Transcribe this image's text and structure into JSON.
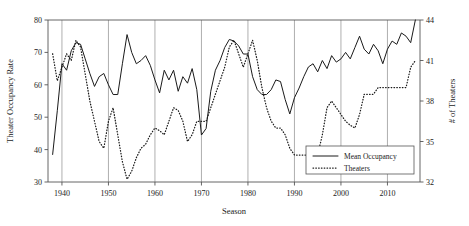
{
  "chart_data": {
    "type": "line",
    "title": "",
    "xlabel": "Season",
    "ylabel": "Theater Occupancy Rate",
    "y2label": "# of Theaters",
    "xlim": [
      1937,
      2017
    ],
    "ylim": [
      30,
      80
    ],
    "y2lim": [
      32,
      44
    ],
    "xticks": [
      1940,
      1950,
      1960,
      1970,
      1980,
      1990,
      2000,
      2010
    ],
    "yticks": [
      30,
      40,
      50,
      60,
      70,
      80
    ],
    "y2ticks": [
      32,
      35,
      38,
      41,
      44
    ],
    "grid": "vertical gridlines at each decade tick",
    "legend_position": "bottom-right inside axes",
    "series": [
      {
        "name": "Mean Occupancy",
        "axis": "left",
        "style": "solid",
        "x": [
          1938,
          1939,
          1940,
          1941,
          1942,
          1943,
          1944,
          1945,
          1946,
          1947,
          1948,
          1949,
          1950,
          1951,
          1952,
          1953,
          1954,
          1955,
          1956,
          1957,
          1958,
          1959,
          1960,
          1961,
          1962,
          1963,
          1964,
          1965,
          1966,
          1967,
          1968,
          1969,
          1970,
          1971,
          1972,
          1973,
          1974,
          1975,
          1976,
          1977,
          1978,
          1979,
          1980,
          1981,
          1982,
          1983,
          1984,
          1985,
          1986,
          1987,
          1988,
          1989,
          1990,
          1991,
          1992,
          1993,
          1994,
          1995,
          1996,
          1997,
          1998,
          1999,
          2000,
          2001,
          2002,
          2003,
          2004,
          2005,
          2006,
          2007,
          2008,
          2009,
          2010,
          2011,
          2012,
          2013,
          2014,
          2015,
          2016
        ],
        "values": [
          38.5,
          52.0,
          66.5,
          64.5,
          70.5,
          73.0,
          72.5,
          68.0,
          63.5,
          59.5,
          62.5,
          63.5,
          60.0,
          57.0,
          57.0,
          66.5,
          75.5,
          70.0,
          66.5,
          67.5,
          69.0,
          66.0,
          61.5,
          57.5,
          64.5,
          61.5,
          64.5,
          58.0,
          62.5,
          60.5,
          65.0,
          58.5,
          44.5,
          46.5,
          58.0,
          64.5,
          67.5,
          71.5,
          74.0,
          73.5,
          72.0,
          69.5,
          69.5,
          62.5,
          58.5,
          57.0,
          57.0,
          58.5,
          61.5,
          61.0,
          55.5,
          51.0,
          56.0,
          59.0,
          62.5,
          65.5,
          66.5,
          64.0,
          67.5,
          65.0,
          69.0,
          67.0,
          68.0,
          70.0,
          68.0,
          71.5,
          75.0,
          71.0,
          69.5,
          72.5,
          70.5,
          66.5,
          71.0,
          73.5,
          72.5,
          76.0,
          75.0,
          73.0,
          80.0
        ],
        "y_min": 38.5,
        "y_max": 80.0
      },
      {
        "name": "Theaters",
        "axis": "right",
        "style": "dotted",
        "x": [
          1938,
          1939,
          1940,
          1941,
          1942,
          1943,
          1944,
          1945,
          1946,
          1947,
          1948,
          1949,
          1950,
          1951,
          1952,
          1953,
          1954,
          1955,
          1956,
          1957,
          1958,
          1959,
          1960,
          1961,
          1962,
          1963,
          1964,
          1965,
          1966,
          1967,
          1968,
          1969,
          1970,
          1971,
          1972,
          1973,
          1974,
          1975,
          1976,
          1977,
          1978,
          1979,
          1980,
          1981,
          1982,
          1983,
          1984,
          1985,
          1986,
          1987,
          1988,
          1989,
          1990,
          1991,
          1992,
          1993,
          1994,
          1995,
          1996,
          1997,
          1998,
          1999,
          2000,
          2001,
          2002,
          2003,
          2004,
          2005,
          2006,
          2007,
          2008,
          2009,
          2010,
          2011,
          2012,
          2013,
          2014,
          2015,
          2016
        ],
        "values": [
          41.5,
          39.5,
          40.5,
          41.5,
          41.0,
          42.5,
          42.0,
          40.0,
          38.0,
          36.5,
          35.0,
          34.5,
          36.5,
          37.5,
          35.5,
          33.5,
          32.2,
          32.8,
          33.8,
          34.5,
          34.8,
          35.5,
          36.0,
          35.8,
          35.5,
          36.5,
          37.5,
          37.3,
          36.5,
          35.0,
          35.5,
          36.5,
          36.5,
          36.5,
          37.5,
          38.5,
          39.5,
          40.5,
          42.0,
          42.5,
          41.5,
          40.5,
          41.5,
          42.5,
          41.0,
          39.0,
          37.5,
          36.5,
          36.0,
          36.0,
          35.5,
          34.5,
          34.0,
          34.0,
          34.0,
          34.0,
          34.0,
          34.0,
          35.5,
          37.5,
          38.0,
          37.5,
          37.0,
          36.5,
          36.2,
          36.0,
          37.0,
          38.5,
          38.5,
          38.5,
          39.0,
          39.0,
          39.0,
          39.0,
          39.0,
          39.0,
          39.0,
          40.5,
          41.0
        ],
        "y_min": 32.2,
        "y_max": 42.5
      }
    ],
    "legend": [
      {
        "label": "Mean Occupancy",
        "style": "solid"
      },
      {
        "label": "Theaters",
        "style": "dotted"
      }
    ]
  },
  "colors": {
    "line": "#1a1a1a",
    "grid": "#9a9a9a",
    "frame": "#555555",
    "background": "#ffffff"
  }
}
